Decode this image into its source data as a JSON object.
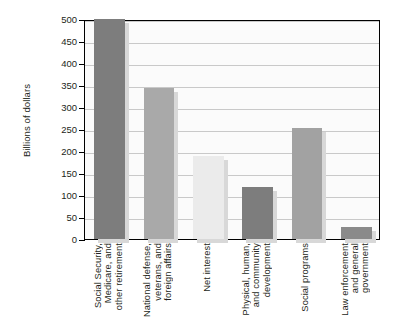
{
  "chart_data": {
    "type": "bar",
    "title": "",
    "xlabel": "",
    "ylabel": "Billions of dollars",
    "ylim": [
      0,
      500
    ],
    "yticks": [
      0,
      50,
      100,
      150,
      200,
      250,
      300,
      350,
      400,
      450,
      500
    ],
    "ytick_labels": [
      "0",
      "50",
      "100",
      "150",
      "200",
      "250",
      "300",
      "350",
      "400",
      "450",
      "500"
    ],
    "grid": "horizontal",
    "legend": "none",
    "categories": [
      "Social Security, Medicare, and other retirement",
      "National defense, veterans, and foreign affairs",
      "Net interest",
      "Physical, human, and community development",
      "Social programs",
      "Law enforcement and general government"
    ],
    "category_lines": [
      [
        "Social Security,",
        "Medicare, and",
        "other retirement"
      ],
      [
        "National defense,",
        "veterans, and",
        "foreign affairs"
      ],
      [
        "Net interest"
      ],
      [
        "Physical, human,",
        "and community",
        "development"
      ],
      [
        "Social programs"
      ],
      [
        "Law enforcement",
        "and general",
        "government"
      ]
    ],
    "values": [
      500,
      343,
      188,
      118,
      253,
      28
    ],
    "bar_colors": [
      "#7d7d7d",
      "#a9a9a9",
      "#ebebeb",
      "#7d7d7d",
      "#a2a2a2",
      "#8a8a8a"
    ]
  },
  "axis": {
    "y_title": "Billions of dollars"
  },
  "colors": {
    "frame": "#000000",
    "gridline": "#c9c9c9",
    "plot_background": "#fbfbfb",
    "text": "#231f20",
    "shadow": "#d8d8d8"
  }
}
